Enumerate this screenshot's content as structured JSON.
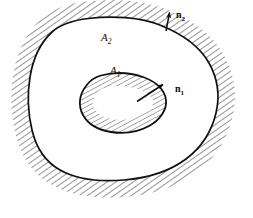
{
  "figure": {
    "background_color": "#ffffff",
    "ink_color": "#111111",
    "hatch_color": "#4a4a4a",
    "width": 253,
    "height": 218
  },
  "labels": {
    "outer_region": {
      "base": "A",
      "subscript": "2",
      "text": "A₂"
    },
    "inner_region": {
      "base": "A",
      "subscript": "1",
      "text": "A₁"
    },
    "outer_normal": {
      "base": "n",
      "subscript": "2",
      "text": "n₂"
    },
    "inner_normal": {
      "base": "n",
      "subscript": "1",
      "text": "n₁"
    }
  },
  "geometry": {
    "outer_curve": "M 88.5,18.5 C 112,15.5 140,17 161,25.5 C 182,34 200,47 209,63 C 218,79 220,96 216,113 C 212,130 202,147 186,159 C 170,171 148,178 124,180 C 100,182 76,179 60,170 C 44,161 36,147 32,130 C 28,113 27,95 30,77 C 33,59 40,43 52,32 C 62,23 75,20 88.5,18.5 Z",
    "inner_curve": "M 101,75.5 C 114,72 130,72.5 143,77 C 156,81.5 165,90 166,100 C 167,110 160,120 149,126 C 138,132 124,134 111,132 C 98,130 88,124 83,115 C 78,106 79,95 86,86 C 90,80.5 95,77 101,75.5 Z",
    "outer_normal_arrow": {
      "x1": 166,
      "y1": 31,
      "x2": 169.5,
      "y2": 10.5
    },
    "inner_normal_arrow": {
      "x1": 137,
      "y1": 101,
      "x2": 165,
      "y2": 83
    },
    "hatch_band_outside_outer": true,
    "hatch_band_inside_inner": true,
    "hatch_angle_deg": 55
  }
}
